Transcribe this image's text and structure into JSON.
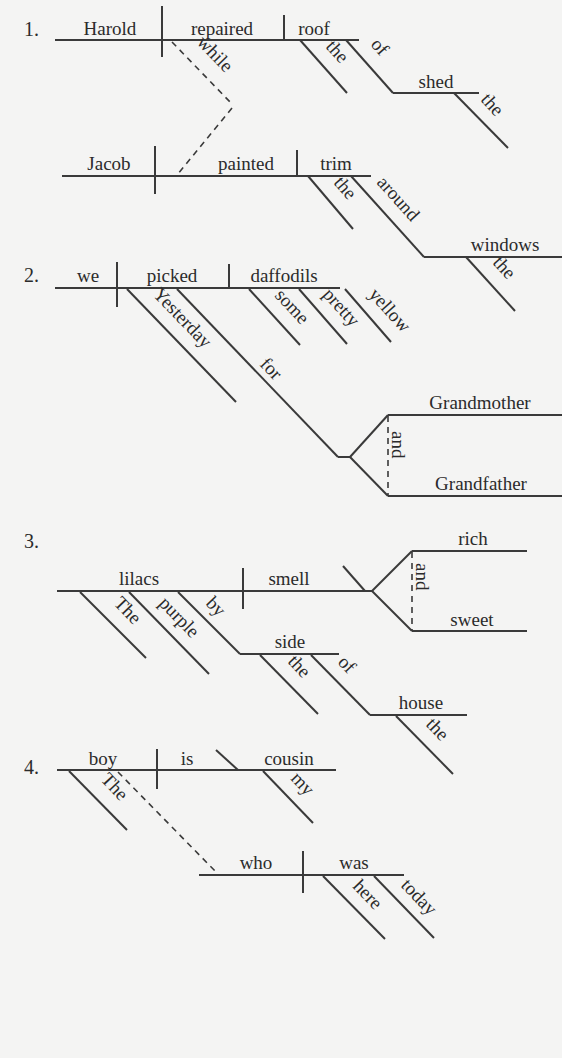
{
  "diagrams": [
    {
      "number": "1.",
      "sentence_clauses": [
        "Harold repaired the roof of the shed",
        "while Jacob painted the trim around the windows"
      ],
      "words": {
        "subject": "Harold",
        "verb": "repaired",
        "object": "roof",
        "object_mod_1": "the",
        "object_prep": "of",
        "prep_object": "shed",
        "prep_object_mod": "the",
        "conjunction": "while",
        "sub_subject": "Jacob",
        "sub_verb": "painted",
        "sub_object": "trim",
        "sub_object_mod": "the",
        "sub_prep": "around",
        "sub_prep_object": "windows",
        "sub_prep_object_mod": "the"
      }
    },
    {
      "number": "2.",
      "words": {
        "subject": "we",
        "verb": "picked",
        "object": "daffodils",
        "verb_mod": "Yesterday",
        "verb_prep": "for",
        "object_mod_1": "some",
        "object_mod_2": "pretty",
        "object_mod_3": "yellow",
        "compound_1": "Grandmother",
        "compound_conj": "and",
        "compound_2": "Grandfather"
      }
    },
    {
      "number": "3.",
      "words": {
        "subject": "lilacs",
        "verb": "smell",
        "subject_mod_1": "The",
        "subject_mod_2": "purple",
        "subject_prep": "by",
        "prep_object": "side",
        "prep_object_mod": "the",
        "prep_2": "of",
        "prep_2_object": "house",
        "prep_2_object_mod": "the",
        "predicate_adj_1": "rich",
        "predicate_conj": "and",
        "predicate_adj_2": "sweet"
      }
    },
    {
      "number": "4.",
      "words": {
        "subject": "boy",
        "verb": "is",
        "predicate_nom": "cousin",
        "subject_mod": "The",
        "predicate_mod": "my",
        "rel_subject": "who",
        "rel_verb": "was",
        "rel_verb_mod_1": "here",
        "rel_verb_mod_2": "today"
      }
    }
  ],
  "colors": {
    "background": "#f4f4f3",
    "line": "#3a3a3a",
    "text": "#2b2b2b"
  }
}
